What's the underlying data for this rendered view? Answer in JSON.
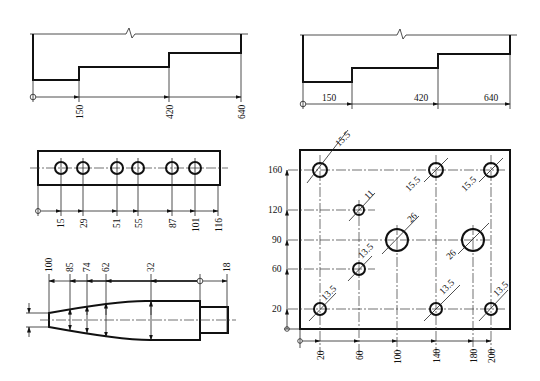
{
  "drawings": [
    {
      "id": "stepped-profile-vertical-dims",
      "description": "Stepped profile with chain dimensions from origin, labels rotated",
      "origin_symbol": "circle",
      "dimensions": [
        "150",
        "420",
        "640"
      ]
    },
    {
      "id": "stepped-profile-horizontal-dims",
      "description": "Stepped profile with cumulative dimensions, labels horizontal",
      "origin_symbol": "circle",
      "dimensions": [
        "150",
        "420",
        "640"
      ]
    },
    {
      "id": "bar-with-holes",
      "description": "Rectangular bar with six holes on center line",
      "origin_symbol": "circle",
      "dimensions": [
        "15",
        "29",
        "51",
        "55",
        "87",
        "101",
        "116"
      ]
    },
    {
      "id": "tapered-shaft",
      "description": "Tapered shaft with stepped end, ordinate dimensions from right",
      "origin_symbol": "circle",
      "dimensions": [
        "100",
        "85",
        "74",
        "62",
        "32",
        "18"
      ]
    },
    {
      "id": "plate-with-holes",
      "description": "Rectangular plate with holes, ordinate coordinates",
      "origin_symbol": "circle",
      "x_dimensions": [
        "20",
        "60",
        "100",
        "140",
        "180",
        "200"
      ],
      "y_dimensions": [
        "20",
        "60",
        "90",
        "120",
        "160"
      ],
      "hole_diameters": {
        "h_20_160": "15.5",
        "h_140_160": "15.5",
        "h_200_160": "15.5",
        "h_60_120": "11",
        "h_100_90": "26",
        "h_180_90": "26",
        "h_60_60": "13.5",
        "h_20_20": "13.5",
        "h_140_20": "13.5",
        "h_200_20": "13.5"
      }
    }
  ]
}
